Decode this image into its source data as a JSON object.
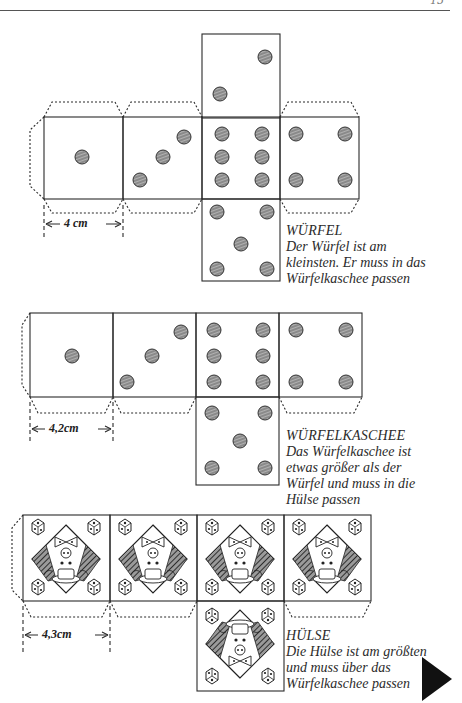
{
  "page": {
    "number": "15"
  },
  "nets": [
    {
      "id": "wuerfel",
      "dimension": "4 cm",
      "caption": {
        "title": "WÜRFEL",
        "lines": [
          "Der Würfel ist am",
          "kleinsten. Er muss in das",
          "Würfelkaschee passen"
        ]
      },
      "faces": [
        "1",
        "3",
        "6",
        "4",
        "2-top",
        "5-bottom"
      ]
    },
    {
      "id": "wuerfelkaschee",
      "dimension": "4,2cm",
      "caption": {
        "title": "WÜRFELKASCHEE",
        "lines": [
          "Das Würfelkaschee ist",
          "etwas größer als der",
          "Würfel und muss in die",
          "Hülse passen"
        ]
      },
      "faces": [
        "1",
        "3",
        "6",
        "4",
        "5-bottom"
      ]
    },
    {
      "id": "huelse",
      "dimension": "4,3cm",
      "caption": {
        "title": "HÜLSE",
        "lines": [
          "Die Hülse ist am größten",
          "und muss über das",
          "Würfelkaschee passen"
        ]
      },
      "faces": [
        "clown-card",
        "clown-card",
        "clown-card",
        "clown-card",
        "clown-card-inverted"
      ]
    }
  ],
  "navigation": {
    "next_icon": "play-triangle-icon"
  },
  "colors": {
    "line": "#2a2a2a",
    "dot": "#6a6a6a",
    "hatch": "#3a3a3a",
    "arrow": "#111111"
  }
}
